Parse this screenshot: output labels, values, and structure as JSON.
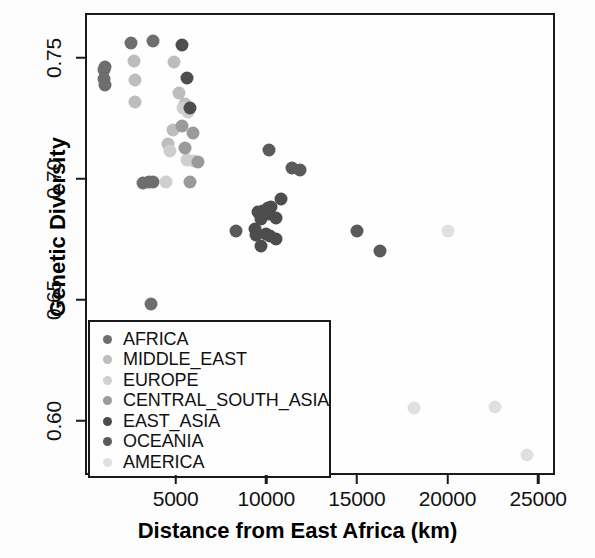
{
  "chart_data": {
    "type": "scatter",
    "title": "",
    "xlabel": "Distance from East Africa (km)",
    "ylabel": "Genetic Diversity",
    "xlim": [
      0,
      25930
    ],
    "ylim": [
      0.5775,
      0.7684
    ],
    "xticks": [
      5000,
      10000,
      15000,
      20000,
      25000
    ],
    "xticklabels": [
      "5000",
      "10000",
      "15000",
      "20000",
      "25000"
    ],
    "yticks": [
      0.6,
      0.65,
      0.7,
      0.75
    ],
    "yticklabels": [
      "0.60",
      "0.65",
      "0.70",
      "0.75"
    ],
    "grid": false,
    "legend_position": "bottom-left",
    "marker_size_px": 13,
    "series": [
      {
        "name": "AFRICA",
        "color": "#6e6e6e",
        "points": [
          [
            920,
            0.7455
          ],
          [
            960,
            0.742
          ],
          [
            1010,
            0.7395
          ],
          [
            1000,
            0.747
          ],
          [
            2450,
            0.757
          ],
          [
            3650,
            0.7575
          ],
          [
            3100,
            0.699
          ],
          [
            3400,
            0.6995
          ],
          [
            3650,
            0.6995
          ],
          [
            3550,
            0.649
          ]
        ]
      },
      {
        "name": "MIDDLE_EAST",
        "color": "#bdbdbd",
        "points": [
          [
            2600,
            0.7495
          ],
          [
            2630,
            0.7415
          ],
          [
            2640,
            0.7325
          ],
          [
            4800,
            0.749
          ],
          [
            5060,
            0.736
          ],
          [
            5400,
            0.7315
          ],
          [
            4750,
            0.721
          ],
          [
            4450,
            0.715
          ]
        ]
      },
      {
        "name": "EUROPE",
        "color": "#cfcfcf",
        "points": [
          [
            5320,
            0.73
          ],
          [
            5580,
            0.7285
          ],
          [
            4600,
            0.712
          ],
          [
            5500,
            0.7085
          ],
          [
            4350,
            0.6995
          ],
          [
            5900,
            0.708
          ]
        ]
      },
      {
        "name": "CENTRAL_SOUTH_ASIA",
        "color": "#9a9a9a",
        "points": [
          [
            5230,
            0.7225
          ],
          [
            5850,
            0.7195
          ],
          [
            6100,
            0.7075
          ],
          [
            5700,
            0.6995
          ],
          [
            5400,
            0.7135
          ]
        ]
      },
      {
        "name": "EAST_ASIA",
        "color": "#4d4d4d",
        "points": [
          [
            5250,
            0.756
          ],
          [
            5520,
            0.7425
          ],
          [
            5700,
            0.73
          ],
          [
            9450,
            0.687
          ],
          [
            9600,
            0.684
          ],
          [
            9700,
            0.6875
          ],
          [
            9980,
            0.6885
          ],
          [
            10050,
            0.686
          ],
          [
            10150,
            0.689
          ],
          [
            10400,
            0.6845
          ],
          [
            9250,
            0.68
          ],
          [
            9320,
            0.6775
          ],
          [
            9850,
            0.678
          ],
          [
            10100,
            0.677
          ],
          [
            10450,
            0.676
          ],
          [
            9600,
            0.673
          ],
          [
            10700,
            0.6925
          ]
        ]
      },
      {
        "name": "OCEANIA",
        "color": "#5a5a5a",
        "points": [
          [
            8200,
            0.679
          ],
          [
            10050,
            0.7125
          ],
          [
            11300,
            0.705
          ],
          [
            11750,
            0.7045
          ],
          [
            14900,
            0.679
          ],
          [
            16150,
            0.671
          ]
        ]
      },
      {
        "name": "AMERICA",
        "color": "#e0e0e0",
        "points": [
          [
            19900,
            0.679
          ],
          [
            18050,
            0.606
          ],
          [
            22500,
            0.6065
          ],
          [
            24300,
            0.5865
          ]
        ]
      }
    ]
  },
  "legend": {
    "items": [
      {
        "label": "AFRICA",
        "color": "#6e6e6e"
      },
      {
        "label": "MIDDLE_EAST",
        "color": "#bdbdbd"
      },
      {
        "label": "EUROPE",
        "color": "#cfcfcf"
      },
      {
        "label": "CENTRAL_SOUTH_ASIA",
        "color": "#9a9a9a"
      },
      {
        "label": "EAST_ASIA",
        "color": "#4d4d4d"
      },
      {
        "label": "OCEANIA",
        "color": "#5a5a5a"
      },
      {
        "label": "AMERICA",
        "color": "#e0e0e0"
      }
    ]
  }
}
